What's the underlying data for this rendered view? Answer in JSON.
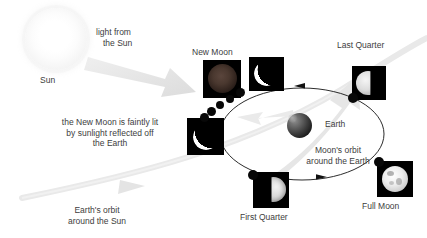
{
  "diagram": {
    "background_color": "#ffffff",
    "text_color": "#3d3d3d"
  },
  "labels": {
    "sun": "Sun",
    "light_from_sun_line1": "light from",
    "light_from_sun_line2": "the Sun",
    "new_moon": "New Moon",
    "last_quarter": "Last Quarter",
    "first_quarter": "First Quarter",
    "full_moon": "Full Moon",
    "earth": "Earth",
    "moons_orbit_line1": "Moon's orbit",
    "moons_orbit_line2": "around the Earth",
    "earths_orbit_line1": "Earth's orbit",
    "earths_orbit_line2": "around the Sun",
    "earthshine_line1": "the New Moon is faintly lit",
    "earthshine_line2": "by sunlight reflected off",
    "earthshine_line3": "the Earth"
  },
  "colors": {
    "panel_background": "#000000",
    "moon_lit": "#ffffff",
    "sunlight_arrow": "#e3e3e3",
    "earth_orbit": "#e6e6e6",
    "moon_orbit_line": "#1a1a1a",
    "new_moon_earthshine": "#4a3a33"
  },
  "moon_phases": [
    {
      "name": "New Moon",
      "illumination_percent": 0,
      "note": "faintly lit by earthshine",
      "panel": {
        "x": 203,
        "y": 60,
        "w": 38,
        "h": 38
      }
    },
    {
      "name": "Waxing crescent (upper)",
      "illumination_percent": 15,
      "panel": {
        "x": 249,
        "y": 57,
        "w": 35,
        "h": 34
      }
    },
    {
      "name": "Waxing crescent (left)",
      "illumination_percent": 18,
      "panel": {
        "x": 187,
        "y": 118,
        "w": 37,
        "h": 37
      }
    },
    {
      "name": "First Quarter",
      "illumination_percent": 50,
      "panel": {
        "x": 253,
        "y": 172,
        "w": 36,
        "h": 36
      }
    },
    {
      "name": "Full Moon",
      "illumination_percent": 100,
      "panel": {
        "x": 377,
        "y": 161,
        "w": 36,
        "h": 36
      }
    },
    {
      "name": "Last Quarter",
      "illumination_percent": 50,
      "panel": {
        "x": 352,
        "y": 66,
        "w": 34,
        "h": 34
      }
    }
  ],
  "orbit": {
    "type": "ellipse",
    "center_x": 302,
    "center_y": 134,
    "radius_x": 82,
    "radius_y": 46,
    "direction": "counterclockwise",
    "arrow_count": 2
  },
  "icon_names": [
    "sun-icon",
    "earth-globe-icon",
    "moon-disc-icon",
    "sunlight-arrow-icon",
    "orbit-arrow-icon"
  ]
}
